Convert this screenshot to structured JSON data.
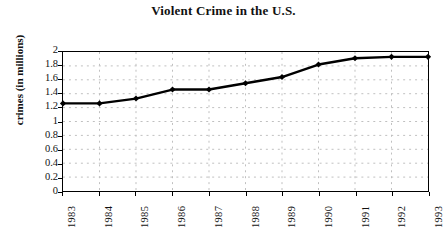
{
  "chart_data": {
    "type": "line",
    "title": "Violent Crime in the U.S.",
    "xlabel": "",
    "ylabel": "crimes (in millions)",
    "categories": [
      "1983",
      "1984",
      "1985",
      "1986",
      "1987",
      "1988",
      "1989",
      "1990",
      "1991",
      "1992",
      "1993"
    ],
    "values": [
      1.26,
      1.26,
      1.33,
      1.46,
      1.46,
      1.55,
      1.64,
      1.82,
      1.91,
      1.93,
      1.93
    ],
    "series": [
      {
        "name": "violent crimes",
        "values": [
          1.26,
          1.26,
          1.33,
          1.46,
          1.46,
          1.55,
          1.64,
          1.82,
          1.91,
          1.93,
          1.93
        ]
      }
    ],
    "ylim": [
      0,
      2
    ],
    "xlim": [
      "1983",
      "1993"
    ],
    "y_ticks": [
      "0",
      "0.2",
      "0.4",
      "0.6",
      "0.8",
      "1",
      "1.2",
      "1.4",
      "1.6",
      "1.8",
      "2"
    ],
    "y_tick_values": [
      0,
      0.2,
      0.4,
      0.6,
      0.8,
      1,
      1.2,
      1.4,
      1.6,
      1.8,
      2
    ],
    "grid": true,
    "grid_style": "dotted",
    "grid_color": "#bfbfbf",
    "legend": "none",
    "line_color": "#000000",
    "marker": "diamond",
    "marker_color": "#000000",
    "axis_color": "#000000",
    "background_color": "#ffffff"
  }
}
